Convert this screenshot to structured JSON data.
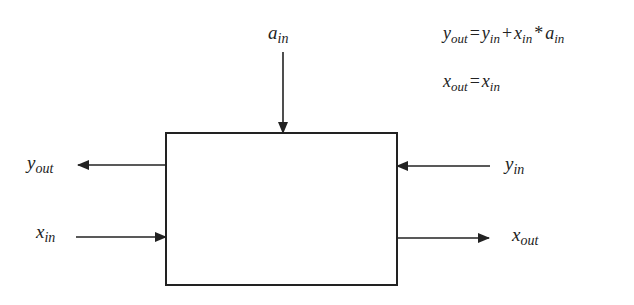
{
  "diagram": {
    "block": {
      "label": ""
    },
    "signals": {
      "a_in": {
        "base": "a",
        "sub": "in",
        "direction": "input-top"
      },
      "y_out": {
        "base": "y",
        "sub": "out",
        "direction": "output-left"
      },
      "x_in": {
        "base": "x",
        "sub": "in",
        "direction": "input-left"
      },
      "y_in": {
        "base": "y",
        "sub": "in",
        "direction": "input-right"
      },
      "x_out": {
        "base": "x",
        "sub": "out",
        "direction": "output-right"
      }
    },
    "equations": [
      {
        "lhs": {
          "base": "y",
          "sub": "out"
        },
        "eq": "=",
        "t1": {
          "base": "y",
          "sub": "in"
        },
        "plus": "+",
        "t2": {
          "base": "x",
          "sub": "in"
        },
        "times": "*",
        "t3": {
          "base": "a",
          "sub": "in"
        }
      },
      {
        "lhs": {
          "base": "x",
          "sub": "out"
        },
        "eq": "=",
        "t1": {
          "base": "x",
          "sub": "in"
        }
      }
    ],
    "colors": {
      "stroke": "#222222",
      "background": "#ffffff"
    }
  }
}
